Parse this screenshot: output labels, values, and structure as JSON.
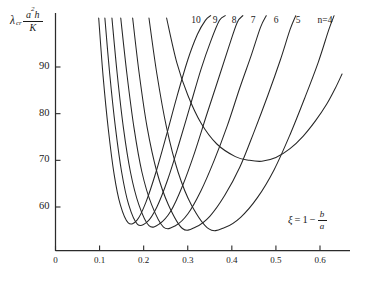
{
  "figure": {
    "name": "buckling-coefficient-chart"
  },
  "chart_data": {
    "type": "line",
    "title": "",
    "subtitle": "",
    "xlabel": "ξ = 1 − b/a",
    "ylabel": "λcr a²h / K",
    "xlabel_parts": {
      "symbol": "ξ",
      "equals": "=",
      "one": "1",
      "minus": "−",
      "numerator": "b",
      "denominator": "a"
    },
    "ylabel_parts": {
      "lambda": "λ",
      "subscript": "cr",
      "numerator": "a",
      "numerator_exponent": "2",
      "numerator_tail": "h",
      "denominator": "K"
    },
    "xlim": [
      0,
      0.66
    ],
    "ylim": [
      52,
      101
    ],
    "grid": false,
    "legend": "curve-end-labels-top",
    "xticks": [
      0,
      0.1,
      0.2,
      0.3,
      0.4,
      0.5,
      0.6
    ],
    "xtick_labels": [
      "0",
      "0.1",
      "0.2",
      "0.3",
      "0.4",
      "0.5",
      "0.6"
    ],
    "yticks": [
      60,
      70,
      80,
      90
    ],
    "ytick_labels": [
      "60",
      "70",
      "80",
      "90"
    ],
    "series": [
      {
        "name": "10",
        "label": "10",
        "label_x": 0.325,
        "minimum": {
          "x": 0.165,
          "y": 56.6
        },
        "x": [
          0.098,
          0.108,
          0.12,
          0.133,
          0.147,
          0.165,
          0.185,
          0.205,
          0.228,
          0.252,
          0.275,
          0.3,
          0.322,
          0.34,
          0.352
        ],
        "y": [
          100.5,
          88.0,
          76.5,
          67.0,
          60.5,
          56.6,
          57.2,
          61.0,
          67.5,
          75.5,
          83.5,
          91.5,
          97.0,
          100.0,
          101.0
        ]
      },
      {
        "name": "9",
        "label": "9",
        "label_x": 0.367,
        "minimum": {
          "x": 0.186,
          "y": 56.3
        },
        "x": [
          0.112,
          0.123,
          0.136,
          0.15,
          0.166,
          0.186,
          0.208,
          0.23,
          0.255,
          0.28,
          0.305,
          0.33,
          0.352,
          0.372,
          0.385
        ],
        "y": [
          100.5,
          88.5,
          77.0,
          67.5,
          60.5,
          56.3,
          56.8,
          60.0,
          66.0,
          73.5,
          81.5,
          89.5,
          95.5,
          100.0,
          101.0
        ]
      },
      {
        "name": "8",
        "label": "8",
        "label_x": 0.418,
        "minimum": {
          "x": 0.212,
          "y": 56.0
        },
        "x": [
          0.128,
          0.14,
          0.154,
          0.17,
          0.189,
          0.212,
          0.236,
          0.262,
          0.288,
          0.315,
          0.342,
          0.368,
          0.392,
          0.412,
          0.425
        ],
        "y": [
          100.5,
          88.5,
          77.0,
          67.5,
          60.5,
          56.0,
          56.4,
          59.2,
          64.5,
          71.5,
          79.5,
          87.0,
          94.0,
          99.5,
          101.0
        ]
      },
      {
        "name": "7",
        "label": "7",
        "label_x": 0.472,
        "minimum": {
          "x": 0.245,
          "y": 55.7
        },
        "x": [
          0.148,
          0.162,
          0.178,
          0.196,
          0.218,
          0.245,
          0.272,
          0.3,
          0.33,
          0.36,
          0.39,
          0.418,
          0.444,
          0.465,
          0.478
        ],
        "y": [
          100.5,
          88.5,
          77.0,
          67.5,
          60.5,
          55.7,
          56.0,
          58.5,
          63.5,
          70.0,
          77.5,
          85.5,
          92.5,
          98.5,
          101.0
        ]
      },
      {
        "name": "6",
        "label": "6",
        "label_x": 0.525,
        "minimum": {
          "x": 0.288,
          "y": 55.4
        },
        "x": [
          0.175,
          0.19,
          0.208,
          0.23,
          0.256,
          0.288,
          0.318,
          0.35,
          0.384,
          0.418,
          0.45,
          0.482,
          0.51,
          0.532,
          0.545
        ],
        "y": [
          100.5,
          88.5,
          77.0,
          67.5,
          60.5,
          55.4,
          55.7,
          58.0,
          62.5,
          68.5,
          76.0,
          84.0,
          91.5,
          98.0,
          101.0
        ]
      },
      {
        "name": "5",
        "label": "5",
        "label_x": 0.575,
        "minimum": {
          "x": 0.348,
          "y": 55.3
        },
        "x": [
          0.212,
          0.23,
          0.252,
          0.278,
          0.308,
          0.348,
          0.384,
          0.42,
          0.458,
          0.496,
          0.532,
          0.566,
          0.596,
          0.62,
          0.632
        ],
        "y": [
          100.5,
          88.5,
          77.0,
          67.5,
          60.5,
          55.3,
          55.6,
          57.8,
          62.0,
          68.0,
          75.5,
          83.5,
          91.0,
          98.0,
          101.0
        ]
      },
      {
        "name": "4",
        "label": "n = 4",
        "label_x": 0.632,
        "minimum": {
          "x": 0.468,
          "y": 69.8
        },
        "x": [
          0.252,
          0.275,
          0.3,
          0.33,
          0.366,
          0.408,
          0.44,
          0.468,
          0.5,
          0.532,
          0.562,
          0.59,
          0.615,
          0.635,
          0.65
        ],
        "y": [
          100.5,
          91.0,
          84.0,
          78.0,
          73.5,
          70.8,
          70.0,
          69.8,
          70.6,
          72.5,
          75.2,
          78.5,
          82.0,
          85.5,
          88.5
        ]
      }
    ]
  },
  "curve_labels": [
    {
      "text": "10",
      "x": 196
    },
    {
      "text": "9",
      "x": 215
    },
    {
      "text": "8",
      "x": 234
    },
    {
      "text": "7",
      "x": 253
    },
    {
      "text": "6",
      "x": 276
    },
    {
      "text": "5",
      "x": 298
    },
    {
      "text": "n=4",
      "x": 325
    }
  ]
}
